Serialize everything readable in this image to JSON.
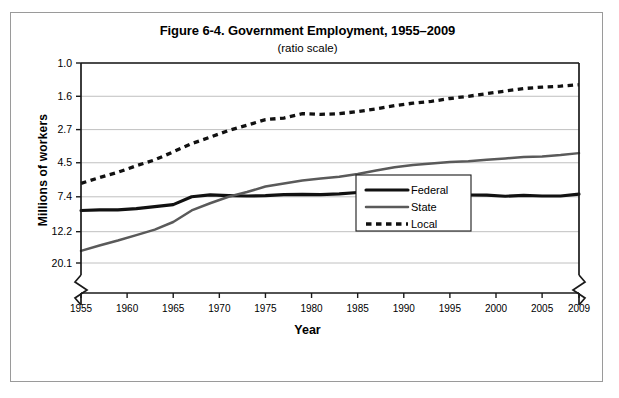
{
  "figure": {
    "title": "Figure 6-4. Government Employment, 1955–2009",
    "subtitle": "(ratio scale)",
    "ylabel": "Millions of workers",
    "xlabel": "Year"
  },
  "legend": {
    "items": [
      {
        "label": "Federal",
        "style": "solid-thick-black",
        "color": "#111111"
      },
      {
        "label": "State",
        "style": "solid-gray",
        "color": "#5a5a5a"
      },
      {
        "label": "Local",
        "style": "dashed-black",
        "color": "#111111"
      }
    ]
  },
  "axes": {
    "y_ticks": [
      "20.1",
      "12.2",
      "7.4",
      "4.5",
      "2.7",
      "1.6",
      "1.0"
    ],
    "x_ticks": [
      "1955",
      "1960",
      "1965",
      "1970",
      "1975",
      "1980",
      "1985",
      "1990",
      "1995",
      "2000",
      "2005",
      "2009"
    ],
    "y_break": true,
    "x_break": true
  },
  "chart_data": {
    "type": "line",
    "title": "Figure 6-4. Government Employment, 1955–2009",
    "subtitle": "(ratio scale)",
    "xlabel": "Year",
    "ylabel": "Millions of workers",
    "yscale": "log",
    "ylim": [
      1.0,
      20.1
    ],
    "ytick_values": [
      1.0,
      1.6,
      2.7,
      4.5,
      7.4,
      12.2,
      20.1
    ],
    "xlim": [
      1955,
      2009
    ],
    "xtick_values": [
      1955,
      1960,
      1965,
      1970,
      1975,
      1980,
      1985,
      1990,
      1995,
      2000,
      2005,
      2009
    ],
    "grid": "horizontal",
    "legend_position": "lower-right-inside",
    "x": [
      1955,
      1957,
      1959,
      1961,
      1963,
      1965,
      1967,
      1969,
      1971,
      1973,
      1975,
      1977,
      1979,
      1981,
      1983,
      1985,
      1987,
      1989,
      1991,
      1993,
      1995,
      1997,
      1999,
      2001,
      2003,
      2005,
      2007,
      2009
    ],
    "series": [
      {
        "name": "Federal",
        "values": [
          2.2,
          2.22,
          2.22,
          2.26,
          2.33,
          2.4,
          2.7,
          2.78,
          2.75,
          2.73,
          2.75,
          2.79,
          2.8,
          2.79,
          2.82,
          2.88,
          2.95,
          2.99,
          3.1,
          2.98,
          2.85,
          2.78,
          2.77,
          2.72,
          2.76,
          2.73,
          2.73,
          2.81
        ]
      },
      {
        "name": "State",
        "values": [
          1.2,
          1.3,
          1.4,
          1.52,
          1.65,
          1.85,
          2.2,
          2.45,
          2.7,
          2.9,
          3.15,
          3.3,
          3.45,
          3.55,
          3.65,
          3.8,
          4.0,
          4.2,
          4.35,
          4.45,
          4.55,
          4.6,
          4.7,
          4.8,
          4.9,
          4.95,
          5.05,
          5.2
        ]
      },
      {
        "name": "Local",
        "values": [
          3.3,
          3.6,
          3.9,
          4.3,
          4.7,
          5.3,
          6.0,
          6.6,
          7.3,
          7.9,
          8.6,
          8.8,
          9.4,
          9.3,
          9.4,
          9.7,
          10.1,
          10.6,
          11.0,
          11.3,
          11.8,
          12.2,
          12.7,
          13.2,
          13.7,
          14.0,
          14.2,
          14.5
        ]
      }
    ]
  }
}
